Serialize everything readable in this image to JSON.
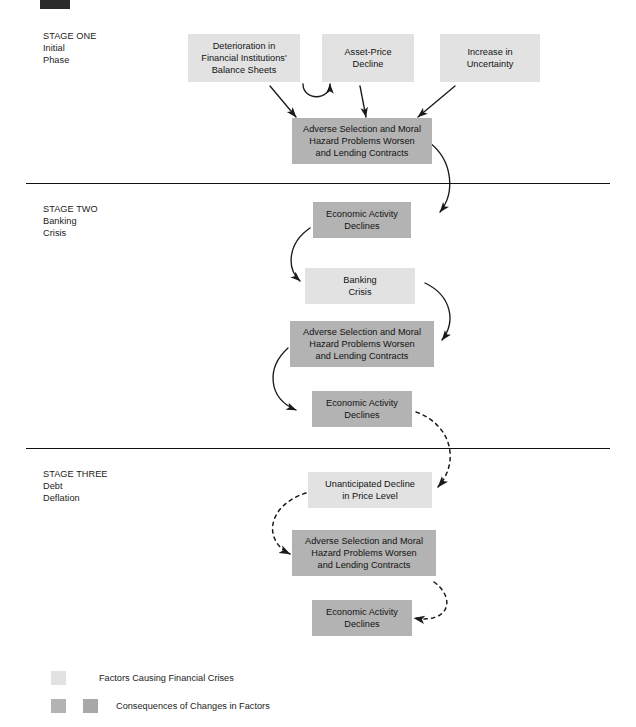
{
  "figure": {
    "width": 636,
    "height": 727,
    "background": "#ffffff",
    "corner_mark_color": "#2b2b2b"
  },
  "colors": {
    "factor_fill": "#e2e2e2",
    "consequence_fill": "#b3b3b3",
    "consequence_fill_alt": "#a8a8a8",
    "text": "#121212",
    "line": "#111111",
    "arrow": "#1a1a1a"
  },
  "stages": [
    {
      "id": "stage-one",
      "lines": "STAGE ONE\nInitial\nPhase"
    },
    {
      "id": "stage-two",
      "lines": "STAGE TWO\nBanking\nCrisis"
    },
    {
      "id": "stage-three",
      "lines": "STAGE THREE\nDebt\nDeflation"
    }
  ],
  "nodes": [
    {
      "id": "deterioration-balance-sheets",
      "label": "Deterioration in\nFinancial Institutions'\nBalance Sheets",
      "kind": "factor"
    },
    {
      "id": "asset-price-decline",
      "label": "Asset-Price\nDecline",
      "kind": "factor"
    },
    {
      "id": "increase-in-uncertainty",
      "label": "Increase in\nUncertainty",
      "kind": "factor"
    },
    {
      "id": "adverse-selection-1",
      "label": "Adverse Selection and Moral\nHazard Problems Worsen\nand Lending Contracts",
      "kind": "consequence"
    },
    {
      "id": "economic-activity-declines-1",
      "label": "Economic Activity\nDeclines",
      "kind": "consequence"
    },
    {
      "id": "banking-crisis",
      "label": "Banking\nCrisis",
      "kind": "factor"
    },
    {
      "id": "adverse-selection-2",
      "label": "Adverse Selection and Moral\nHazard Problems Worsen\nand Lending Contracts",
      "kind": "consequence"
    },
    {
      "id": "economic-activity-declines-2",
      "label": "Economic Activity\nDeclines",
      "kind": "consequence"
    },
    {
      "id": "unanticipated-decline-price",
      "label": "Unanticipated Decline\nin Price Level",
      "kind": "factor"
    },
    {
      "id": "adverse-selection-3",
      "label": "Adverse Selection and Moral\nHazard Problems Worsen\nand Lending Contracts",
      "kind": "consequence"
    },
    {
      "id": "economic-activity-declines-3",
      "label": "Economic Activity\nDeclines",
      "kind": "consequence"
    }
  ],
  "legend": {
    "rows": [
      {
        "id": "legend-factors",
        "label": "Factors Causing Financial Crises",
        "swatches": 1
      },
      {
        "id": "legend-consequences",
        "label": "Consequences of Changes in Factors",
        "swatches": 2
      }
    ]
  }
}
